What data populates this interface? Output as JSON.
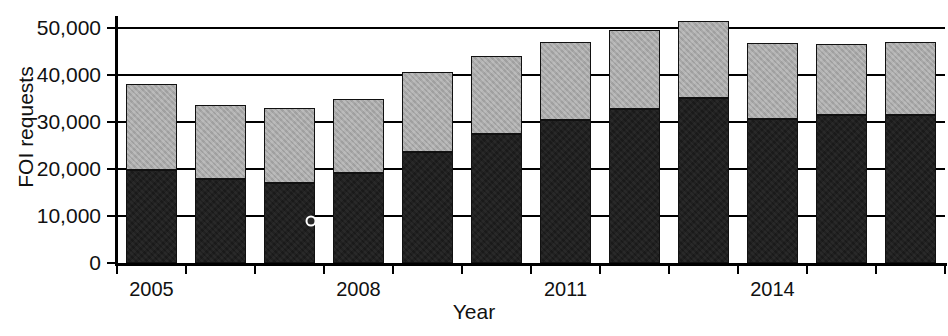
{
  "chart_data": {
    "type": "bar",
    "stacked": true,
    "title": "",
    "xlabel": "Year",
    "ylabel": "FOI requests",
    "categories": [
      "2005",
      "2006",
      "2007",
      "2008",
      "2009",
      "2010",
      "2011",
      "2012",
      "2013",
      "2014",
      "2015",
      "2016"
    ],
    "x_tick_labels": [
      "2005",
      "2008",
      "2011",
      "2014"
    ],
    "x_tick_label_categories": [
      "2005",
      "2008",
      "2011",
      "2014"
    ],
    "y_tick_labels": [
      "0",
      "10,000",
      "20,000",
      "30,000",
      "40,000",
      "50,000"
    ],
    "y_tick_values": [
      0,
      10000,
      20000,
      30000,
      40000,
      50000
    ],
    "ylim": [
      0,
      52500
    ],
    "grid": "horizontal",
    "legend": "none",
    "series": [
      {
        "name": "lower-segment",
        "color": "#1a1a1a",
        "values": [
          19800,
          17900,
          17000,
          19200,
          23500,
          27400,
          30400,
          32800,
          35100,
          30700,
          31500,
          31500
        ]
      },
      {
        "name": "upper-segment",
        "color": "#a8a8a8",
        "values": [
          18200,
          15700,
          15900,
          15700,
          17000,
          16500,
          16600,
          16700,
          16400,
          16000,
          15000,
          15500
        ]
      }
    ],
    "totals": [
      38000,
      33600,
      32900,
      34900,
      40500,
      43900,
      47000,
      49500,
      51500,
      46700,
      46500,
      47000
    ],
    "annotations": [
      {
        "name": "data-marker",
        "category": "2007",
        "value": 9000
      }
    ]
  },
  "geometry": {
    "plot_left": 117,
    "plot_right": 945,
    "plot_top": 16,
    "plot_bottom": 263,
    "bar_gap_ratio": 0.25
  }
}
